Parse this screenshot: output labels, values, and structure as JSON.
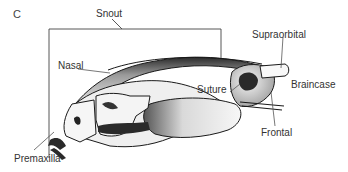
{
  "panel_label": "C",
  "labels": {
    "snout": "Snout",
    "nasal": "Nasal",
    "supraorbital": "Supraorbital",
    "suture": "Suture",
    "braincase": "Braincase",
    "frontal": "Frontal",
    "premaxilla": "Premaxilla"
  },
  "colors": {
    "ink": "#1a1a1a",
    "shade": "#8a8a8a",
    "light": "#e6e6e6",
    "leader": "#555555"
  }
}
